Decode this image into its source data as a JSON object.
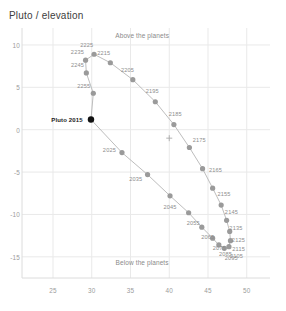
{
  "chart": {
    "title": "Pluto / elevation",
    "annotations": {
      "above": "Above the planets",
      "below": "Below the planets"
    }
  },
  "chart_data": {
    "type": "scatter",
    "title": "Pluto / elevation",
    "xlabel": "",
    "ylabel": "",
    "xlim": [
      21,
      53
    ],
    "ylim": [
      -17.5,
      12
    ],
    "xticks": [
      25,
      30,
      35,
      40,
      45,
      50
    ],
    "yticks": [
      10,
      5,
      0,
      -5,
      -10,
      -15
    ],
    "grid": true,
    "legend": false,
    "annotations": [
      {
        "text": "Above the planets",
        "x": 36.5,
        "y": 11.2
      },
      {
        "text": "Below the planets",
        "x": 36.5,
        "y": -15.6
      },
      {
        "text": "Pluto 2015",
        "x": 29.0,
        "y": 1.2,
        "marker": "filled-black"
      },
      {
        "text": "+",
        "x": 40.0,
        "y": -1.0,
        "marker": "cross"
      }
    ],
    "series": [
      {
        "name": "Pluto orbit decades",
        "marker": "circle",
        "color": "#9a9a9a",
        "points": [
          {
            "label": "2015",
            "x": 29.9,
            "y": 1.2,
            "highlight": true
          },
          {
            "label": "2025",
            "x": 33.9,
            "y": -2.7
          },
          {
            "label": "2035",
            "x": 37.2,
            "y": -5.3
          },
          {
            "label": "2045",
            "x": 40.1,
            "y": -7.8
          },
          {
            "label": "2055",
            "x": 42.5,
            "y": -9.8
          },
          {
            "label": "2065",
            "x": 44.2,
            "y": -11.5
          },
          {
            "label": "2075",
            "x": 45.6,
            "y": -12.8
          },
          {
            "label": "2085",
            "x": 46.4,
            "y": -13.6
          },
          {
            "label": "2095",
            "x": 47.1,
            "y": -14.0
          },
          {
            "label": "2105",
            "x": 47.7,
            "y": -13.8
          },
          {
            "label": "2115",
            "x": 47.9,
            "y": -13.1
          },
          {
            "label": "2125",
            "x": 47.8,
            "y": -12.0
          },
          {
            "label": "2135",
            "x": 47.4,
            "y": -10.7
          },
          {
            "label": "2145",
            "x": 46.7,
            "y": -8.9
          },
          {
            "label": "2155",
            "x": 45.6,
            "y": -6.9
          },
          {
            "label": "2165",
            "x": 44.3,
            "y": -4.6
          },
          {
            "label": "2175",
            "x": 42.6,
            "y": -2.1
          },
          {
            "label": "2185",
            "x": 40.6,
            "y": 0.6
          },
          {
            "label": "2195",
            "x": 38.2,
            "y": 3.3
          },
          {
            "label": "2205",
            "x": 35.3,
            "y": 5.9
          },
          {
            "label": "2215",
            "x": 32.4,
            "y": 7.9
          },
          {
            "label": "2225",
            "x": 30.3,
            "y": 8.9
          },
          {
            "label": "2235",
            "x": 29.2,
            "y": 8.2
          },
          {
            "label": "2245",
            "x": 29.3,
            "y": 6.7
          },
          {
            "label": "2255",
            "x": 30.2,
            "y": 4.3
          }
        ]
      }
    ]
  }
}
